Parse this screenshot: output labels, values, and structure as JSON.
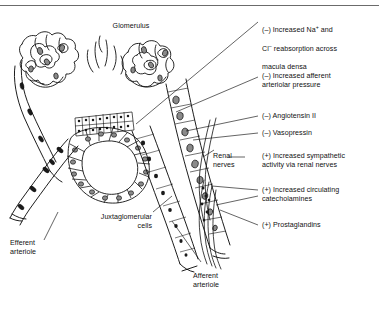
{
  "figure": {
    "title_label": "Glomerulus",
    "type": "anatomical-diagram",
    "line_color": "#111111",
    "background_color": "#ffffff",
    "nucleus_fill": "#8a8a8a"
  },
  "structure_labels": {
    "glomerulus": "Glomerulus",
    "juxtaglomerular_cells": "Juxtaglomerular\ncells",
    "efferent_arteriole": "Efferent\narteriole",
    "afferent_arteriole": "Afferent\narteriole",
    "renal_nerves": "Renal\nnerves"
  },
  "factors": [
    {
      "id": "macula-densa",
      "sign": "(–)",
      "line1_pre": "(–) Increased Na",
      "line1_sup": "+",
      "line1_post": " and",
      "line2_pre": "Cl",
      "line2_sup": "–",
      "line2_post": " reabsorption across",
      "line3": "macula densa",
      "text": "(–) Increased Na+ and Cl– reabsorption across macula densa"
    },
    {
      "id": "afferent-pressure",
      "sign": "(–)",
      "text": "(–) Increased afferent\narteriolar pressure"
    },
    {
      "id": "angiotensin-ii",
      "sign": "(–)",
      "text": "(–) Angiotensin II"
    },
    {
      "id": "vasopressin",
      "sign": "(–)",
      "text": "(–) Vasopressin"
    },
    {
      "id": "sympathetic-activity",
      "sign": "(+)",
      "text": "(+) Increased sympathetic\nactivity via renal nerves"
    },
    {
      "id": "catecholamines",
      "sign": "(+)",
      "text": "(+) Increased circulating\ncatecholamines"
    },
    {
      "id": "prostaglandins",
      "sign": "(+)",
      "text": "(+) Prostaglandins"
    }
  ]
}
